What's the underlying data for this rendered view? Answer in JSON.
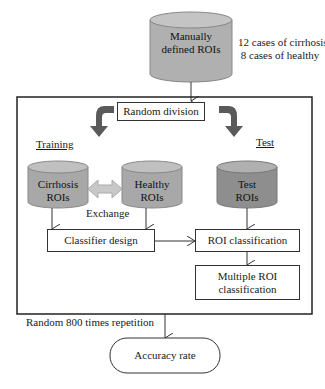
{
  "diagram": {
    "source": {
      "label_line1": "Manually",
      "label_line2": "defined ROIs"
    },
    "source_note": {
      "line1": "12 cases of cirrhosis",
      "line2": "8 cases of healthy"
    },
    "random_division": "Random division",
    "training_label": "Training",
    "test_label": "Test",
    "cirrhosis": {
      "line1": "Cirrhosis",
      "line2": "ROIs"
    },
    "healthy": {
      "line1": "Healthy",
      "line2": "ROIs"
    },
    "test_rois": {
      "line1": "Test",
      "line2": "ROIs"
    },
    "exchange": "Exchange",
    "classifier_design": "Classifier design",
    "roi_classification": "ROI classification",
    "multiple_roi": {
      "line1": "Multiple ROI",
      "line2": "classification"
    },
    "repetition": "Random 800 times repetition",
    "accuracy": "Accuracy rate",
    "colors": {
      "cylinder_light": "#b8b8b8",
      "cylinder_dark": "#8a8a8a",
      "arrow_dark": "#5a5a5a",
      "exchange_arrow": "#c8c8c8"
    }
  }
}
